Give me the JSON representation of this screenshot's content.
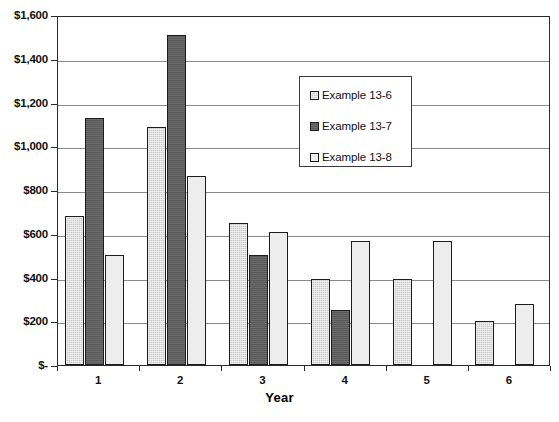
{
  "chart_data": {
    "type": "bar",
    "title": "",
    "xlabel": "Year",
    "ylabel": "",
    "categories": [
      "1",
      "2",
      "3",
      "4",
      "5",
      "6"
    ],
    "series": [
      {
        "name": "Example 13-6",
        "color": "#c9c9c9",
        "values": [
          680,
          1090,
          650,
          395,
          395,
          200
        ]
      },
      {
        "name": "Example 13-7",
        "color": "#5a5a5a",
        "values": [
          1130,
          1510,
          505,
          250,
          null,
          null
        ]
      },
      {
        "name": "Example 13-8",
        "color": "#ededed",
        "values": [
          505,
          865,
          610,
          565,
          565,
          280
        ]
      }
    ],
    "ylim": [
      0,
      1600
    ],
    "ytick_values": [
      0,
      200,
      400,
      600,
      800,
      1000,
      1200,
      1400,
      1600
    ],
    "ytick_labels": [
      "$-",
      "$200",
      "$400",
      "$600",
      "$800",
      "$1,000",
      "$1,200",
      "$1,400",
      "$1,600"
    ],
    "grid": true,
    "legend_position": "inside-upper-center"
  },
  "legend": {
    "entries": [
      {
        "label": "Example 13-6",
        "swatch": "#c9c9c9"
      },
      {
        "label": "Example 13-7",
        "swatch": "#5a5a5a"
      },
      {
        "label": "Example 13-8",
        "swatch": "#ededed"
      }
    ]
  },
  "axis": {
    "x_title": "Year"
  }
}
